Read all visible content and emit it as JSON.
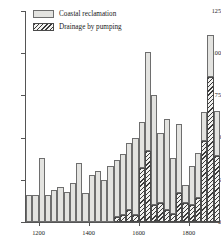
{
  "chart_data": {
    "type": "bar",
    "title": "",
    "subtitle": "",
    "xlabel": "",
    "ylabel": "",
    "xlim": [
      1150,
      1925
    ],
    "ylim": [
      0,
      125
    ],
    "grid": false,
    "stacked": true,
    "bar_width_years": 25,
    "legend_position": "top-left",
    "x_ticks": [
      1200,
      1400,
      1600,
      1800
    ],
    "x_tick_labels": [
      "1200",
      "1400",
      "1600",
      "1800"
    ],
    "y_ticks": [
      0,
      25,
      50,
      75,
      100,
      125
    ],
    "y_tick_labels": [
      "0",
      "25",
      "50",
      "75",
      "100",
      "125"
    ],
    "categories": [
      1150,
      1175,
      1200,
      1225,
      1250,
      1275,
      1300,
      1325,
      1350,
      1375,
      1400,
      1425,
      1450,
      1475,
      1500,
      1525,
      1550,
      1575,
      1600,
      1625,
      1650,
      1675,
      1700,
      1725,
      1750,
      1775,
      1800,
      1825,
      1850,
      1875,
      1900
    ],
    "series": [
      {
        "name": "Coastal reclamation",
        "color": "#e3e3e0",
        "pattern": "solid",
        "values": [
          16,
          16,
          38,
          16,
          19,
          21,
          18,
          23,
          35,
          17,
          28,
          30,
          25,
          33,
          34,
          36,
          40,
          46,
          27,
          59,
          65,
          42,
          54,
          33,
          41,
          11,
          23,
          27,
          17,
          25,
          27
        ]
      },
      {
        "name": "Drainage by pumping",
        "color": "#3a3a3a",
        "pattern": "diagonal-hatch",
        "values": [
          0,
          0,
          0,
          0,
          0,
          0,
          0,
          0,
          0,
          0,
          0,
          0,
          0,
          0,
          3,
          4,
          7,
          4,
          32,
          42,
          10,
          11,
          7,
          5,
          17,
          11,
          10,
          14,
          48,
          86,
          39
        ]
      }
    ],
    "totals": [
      16,
      16,
      38,
      16,
      19,
      21,
      18,
      23,
      35,
      17,
      28,
      30,
      25,
      33,
      37,
      40,
      47,
      50,
      59,
      101,
      75,
      53,
      61,
      38,
      58,
      22,
      33,
      41,
      65,
      111,
      66
    ]
  },
  "legend": {
    "items": [
      {
        "label": "Coastal reclamation",
        "swatch": "solid-light-gray"
      },
      {
        "label": "Drainage by pumping",
        "swatch": "diagonal-hatch"
      }
    ]
  },
  "colors": {
    "coastal_fill": "#e3e3e0",
    "coastal_edge": "#6e6e6e",
    "drain_hatch": "#3a3a3a",
    "drain_edge": "#4a4a4a",
    "axis": "#555555",
    "text": "#1a1a1a",
    "background": "#ffffff"
  }
}
